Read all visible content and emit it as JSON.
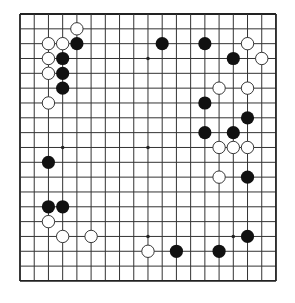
{
  "board": {
    "size": 19,
    "origin_x": 20,
    "origin_y": 14,
    "spacing_x": 14.22,
    "spacing_y": 14.83,
    "stone_radius": 6.6,
    "line_color": "#333333",
    "border_color": "#222222",
    "black_color": "#111111",
    "white_fill": "#ffffff",
    "white_stroke": "#222222",
    "star_points": [
      [
        3,
        3
      ],
      [
        9,
        3
      ],
      [
        15,
        3
      ],
      [
        3,
        9
      ],
      [
        9,
        9
      ],
      [
        15,
        9
      ],
      [
        3,
        15
      ],
      [
        9,
        15
      ],
      [
        15,
        15
      ]
    ]
  },
  "stones": {
    "black": [
      [
        4,
        2
      ],
      [
        3,
        3
      ],
      [
        3,
        4
      ],
      [
        3,
        5
      ],
      [
        10,
        2
      ],
      [
        13,
        2
      ],
      [
        15,
        3
      ],
      [
        13,
        6
      ],
      [
        16,
        7
      ],
      [
        13,
        8
      ],
      [
        15,
        8
      ],
      [
        16,
        11
      ],
      [
        2,
        10
      ],
      [
        2,
        13
      ],
      [
        3,
        13
      ],
      [
        11,
        16
      ],
      [
        14,
        16
      ],
      [
        16,
        15
      ]
    ],
    "white": [
      [
        4,
        1
      ],
      [
        2,
        2
      ],
      [
        3,
        2
      ],
      [
        2,
        3
      ],
      [
        2,
        4
      ],
      [
        2,
        6
      ],
      [
        16,
        2
      ],
      [
        17,
        3
      ],
      [
        14,
        5
      ],
      [
        16,
        5
      ],
      [
        14,
        9
      ],
      [
        15,
        9
      ],
      [
        16,
        9
      ],
      [
        14,
        11
      ],
      [
        2,
        14
      ],
      [
        3,
        15
      ],
      [
        5,
        15
      ],
      [
        9,
        16
      ]
    ]
  }
}
